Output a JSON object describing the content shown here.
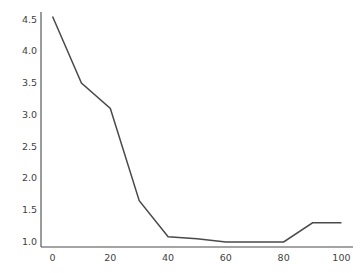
{
  "figure": {
    "background_color": "#ffffff",
    "clipped_title": "",
    "axis_color": "#4a4a4a",
    "tick_label_color": "#3f3f3f"
  },
  "chart_data": {
    "type": "line",
    "title": "",
    "subtitle": "",
    "xlabel": "",
    "ylabel": "",
    "x": [
      0,
      10,
      20,
      30,
      40,
      50,
      60,
      70,
      80,
      90,
      100
    ],
    "values": [
      4.55,
      3.5,
      3.1,
      1.65,
      1.08,
      1.05,
      1.0,
      1.0,
      1.0,
      1.3,
      1.3
    ],
    "series": [
      {
        "name": "series-1",
        "color": "#4a4a4a",
        "line_width": 1.5,
        "marker": "none",
        "values": [
          4.55,
          3.5,
          3.1,
          1.65,
          1.08,
          1.05,
          1.0,
          1.0,
          1.0,
          1.3,
          1.3
        ]
      }
    ],
    "xlim": [
      -4,
      104
    ],
    "ylim": [
      0.92,
      4.62
    ],
    "xticks": [
      0,
      20,
      40,
      60,
      80,
      100
    ],
    "yticks": [
      1.0,
      1.5,
      2.0,
      2.5,
      3.0,
      3.5,
      4.0,
      4.5
    ],
    "xtick_labels": [
      "0",
      "20",
      "40",
      "60",
      "80",
      "100"
    ],
    "ytick_labels": [
      "1.0",
      "1.5",
      "2.0",
      "2.5",
      "3.0",
      "3.5",
      "4.0",
      "4.5"
    ],
    "grid": false,
    "legend": null,
    "legend_position": "none",
    "annotations": []
  }
}
